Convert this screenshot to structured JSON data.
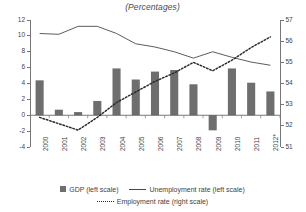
{
  "chart_data": {
    "type": "bar",
    "title": "(Percentages)",
    "xlabel": "",
    "ylabel": "",
    "categories": [
      "2000",
      "2001",
      "2002",
      "2003",
      "2004",
      "2005",
      "2006",
      "2007",
      "2008",
      "2009",
      "2010",
      "2011",
      "2012*"
    ],
    "ylim": [
      -4,
      12
    ],
    "y2lim": [
      51,
      57
    ],
    "yticks": [
      12,
      10,
      8,
      6,
      4,
      2,
      0,
      -2,
      -4
    ],
    "y2ticks": [
      57,
      56,
      55,
      54,
      53,
      52,
      51
    ],
    "grid": false,
    "legend_position": "bottom",
    "series": [
      {
        "name": "GDP (left scale)",
        "type": "bar",
        "axis": "left",
        "color": "#6e6e6e",
        "values": [
          4.4,
          0.7,
          0.4,
          1.8,
          5.9,
          4.5,
          5.5,
          5.7,
          3.9,
          -1.9,
          5.9,
          4.1,
          3.0
        ]
      },
      {
        "name": "Unemployment rate (left scale)",
        "type": "line",
        "axis": "left",
        "color": "#4a4a4a",
        "values": [
          10.3,
          10.2,
          11.2,
          11.2,
          10.3,
          9.0,
          8.6,
          8.0,
          7.2,
          8.0,
          7.3,
          6.7,
          6.3
        ]
      },
      {
        "name": "Employment rate (right scale)",
        "type": "line",
        "axis": "right",
        "color": "#2b2b2b",
        "values": [
          52.4,
          52.1,
          51.8,
          52.4,
          53.1,
          53.6,
          54.1,
          54.5,
          55.0,
          54.6,
          55.1,
          55.7,
          56.2
        ]
      }
    ]
  },
  "legend": {
    "gdp": "GDP (left scale)",
    "unemployment": "Unemployment rate (left scale)",
    "employment": "Employment rate (right scale)"
  }
}
